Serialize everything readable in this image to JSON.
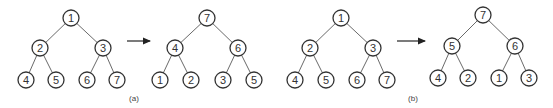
{
  "diagrams": [
    {
      "caption": "(a)",
      "before": {
        "root": "1",
        "level1": [
          "2",
          "3"
        ],
        "level2": [
          "4",
          "5",
          "6",
          "7"
        ]
      },
      "after": {
        "root": "7",
        "level1": [
          "4",
          "6"
        ],
        "level2": [
          "1",
          "2",
          "3",
          "5"
        ]
      }
    },
    {
      "caption": "(b)",
      "before": {
        "root": "1",
        "level1": [
          "2",
          "3"
        ],
        "level2": [
          "4",
          "5",
          "6",
          "7"
        ]
      },
      "after": {
        "root": "7",
        "level1": [
          "5",
          "6"
        ],
        "level2": [
          "4",
          "2",
          "1",
          "3"
        ]
      }
    }
  ]
}
